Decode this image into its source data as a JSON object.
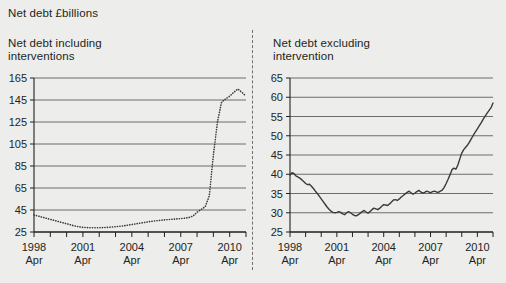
{
  "figure": {
    "title": "Net debt £billions",
    "background_color": "#ededec",
    "ink_color": "#231f20"
  },
  "divider": {
    "style": "dashed-vertical"
  },
  "chart_data": [
    {
      "type": "line",
      "panel": "left",
      "title": "Net debt including\ninterventions",
      "xlabel": "",
      "ylabel": "",
      "line_style": "dotted",
      "grid": true,
      "legend": "none",
      "ylim": [
        25,
        165
      ],
      "yticks": [
        25,
        45,
        65,
        85,
        105,
        125,
        145,
        165
      ],
      "ytick_labels": [
        "25",
        "45",
        "65",
        "85",
        "105",
        "125",
        "145",
        "165"
      ],
      "xlim": [
        1998.0,
        2011.0
      ],
      "xticks": [
        1998,
        1999,
        2000,
        2001,
        2002,
        2003,
        2004,
        2005,
        2006,
        2007,
        2008,
        2009,
        2010,
        2011
      ],
      "xtick_labels": [
        "1998\nApr",
        "2001\nApr",
        "2004\nApr",
        "2007\nApr",
        "2010\nApr"
      ],
      "xtick_label_positions": [
        1998,
        2001,
        2004,
        2007,
        2010
      ],
      "x": [
        1998.0,
        1998.25,
        1998.5,
        1998.75,
        1999.0,
        1999.25,
        1999.5,
        1999.75,
        2000.0,
        2000.25,
        2000.5,
        2000.75,
        2001.0,
        2001.25,
        2001.5,
        2001.75,
        2002.0,
        2002.25,
        2002.5,
        2002.75,
        2003.0,
        2003.25,
        2003.5,
        2003.75,
        2004.0,
        2004.25,
        2004.5,
        2004.75,
        2005.0,
        2005.25,
        2005.5,
        2005.75,
        2006.0,
        2006.25,
        2006.5,
        2006.75,
        2007.0,
        2007.25,
        2007.5,
        2007.75,
        2008.0,
        2008.25,
        2008.5,
        2008.75,
        2009.0,
        2009.25,
        2009.5,
        2009.75,
        2010.0,
        2010.25,
        2010.5,
        2010.75,
        2011.0
      ],
      "values": [
        40.5,
        39.5,
        38.5,
        37.5,
        36.5,
        35.5,
        34.5,
        33.5,
        32.5,
        31.5,
        30.5,
        29.8,
        29.2,
        29.0,
        28.8,
        28.8,
        28.9,
        29.0,
        29.2,
        29.5,
        29.8,
        30.2,
        30.6,
        31.2,
        31.8,
        32.4,
        33.0,
        33.6,
        34.2,
        34.8,
        35.2,
        35.6,
        36.0,
        36.3,
        36.6,
        36.9,
        37.2,
        37.6,
        38.2,
        39.5,
        43.0,
        45.5,
        48.0,
        58.0,
        95.0,
        125.0,
        143.0,
        146.0,
        148.5,
        152.0,
        155.0,
        152.0,
        148.5
      ],
      "annotations": []
    },
    {
      "type": "line",
      "panel": "right",
      "title": "Net debt excluding\nintervention",
      "xlabel": "",
      "ylabel": "",
      "line_style": "solid",
      "grid": true,
      "legend": "none",
      "ylim": [
        25,
        65
      ],
      "yticks": [
        25,
        30,
        35,
        40,
        45,
        50,
        55,
        60,
        65
      ],
      "ytick_labels": [
        "25",
        "30",
        "35",
        "40",
        "45",
        "50",
        "55",
        "60",
        "65"
      ],
      "xlim": [
        1998.0,
        2011.0
      ],
      "xticks": [
        1998,
        1999,
        2000,
        2001,
        2002,
        2003,
        2004,
        2005,
        2006,
        2007,
        2008,
        2009,
        2010,
        2011
      ],
      "xtick_labels": [
        "1998\nApr",
        "2001\nApr",
        "2004\nApr",
        "2007\nApr",
        "2010\nApr"
      ],
      "xtick_label_positions": [
        1998,
        2001,
        2004,
        2007,
        2010
      ],
      "x": [
        1998.0,
        1998.125,
        1998.25,
        1998.375,
        1998.5,
        1998.625,
        1998.75,
        1998.875,
        1999.0,
        1999.125,
        1999.25,
        1999.375,
        1999.5,
        1999.625,
        1999.75,
        1999.875,
        2000.0,
        2000.125,
        2000.25,
        2000.375,
        2000.5,
        2000.625,
        2000.75,
        2000.875,
        2001.0,
        2001.125,
        2001.25,
        2001.375,
        2001.5,
        2001.625,
        2001.75,
        2001.875,
        2002.0,
        2002.125,
        2002.25,
        2002.375,
        2002.5,
        2002.625,
        2002.75,
        2002.875,
        2003.0,
        2003.125,
        2003.25,
        2003.375,
        2003.5,
        2003.625,
        2003.75,
        2003.875,
        2004.0,
        2004.125,
        2004.25,
        2004.375,
        2004.5,
        2004.625,
        2004.75,
        2004.875,
        2005.0,
        2005.125,
        2005.25,
        2005.375,
        2005.5,
        2005.625,
        2005.75,
        2005.875,
        2006.0,
        2006.125,
        2006.25,
        2006.375,
        2006.5,
        2006.625,
        2006.75,
        2006.875,
        2007.0,
        2007.125,
        2007.25,
        2007.375,
        2007.5,
        2007.625,
        2007.75,
        2007.875,
        2008.0,
        2008.125,
        2008.25,
        2008.375,
        2008.5,
        2008.625,
        2008.75,
        2008.875,
        2009.0,
        2009.125,
        2009.25,
        2009.375,
        2009.5,
        2009.625,
        2009.75,
        2009.875,
        2010.0,
        2010.125,
        2010.25,
        2010.375,
        2010.5,
        2010.625,
        2010.75,
        2010.875,
        2011.0
      ],
      "values": [
        39.8,
        40.4,
        40.2,
        39.6,
        39.3,
        39.0,
        38.6,
        38.1,
        37.6,
        37.3,
        37.4,
        36.9,
        36.3,
        35.6,
        35.0,
        34.3,
        33.6,
        32.9,
        32.2,
        31.5,
        30.9,
        30.4,
        30.1,
        30.0,
        30.1,
        30.3,
        30.1,
        29.7,
        29.5,
        30.0,
        30.3,
        30.0,
        29.6,
        29.3,
        29.2,
        29.5,
        29.9,
        30.3,
        30.6,
        30.2,
        29.9,
        30.3,
        30.8,
        31.2,
        31.0,
        30.8,
        31.2,
        31.7,
        32.1,
        32.0,
        31.9,
        32.3,
        32.8,
        33.3,
        33.4,
        33.2,
        33.6,
        34.1,
        34.5,
        34.9,
        35.3,
        35.6,
        35.2,
        34.8,
        35.1,
        35.5,
        35.8,
        35.4,
        35.1,
        35.3,
        35.6,
        35.4,
        35.2,
        35.5,
        35.6,
        35.4,
        35.3,
        35.6,
        35.9,
        36.6,
        37.6,
        38.7,
        39.9,
        41.2,
        41.6,
        41.3,
        42.4,
        44.0,
        45.5,
        46.4,
        47.0,
        47.6,
        48.4,
        49.3,
        50.2,
        51.0,
        51.8,
        52.6,
        53.4,
        54.3,
        55.1,
        55.9,
        56.6,
        57.3,
        58.5
      ],
      "annotations": []
    }
  ]
}
